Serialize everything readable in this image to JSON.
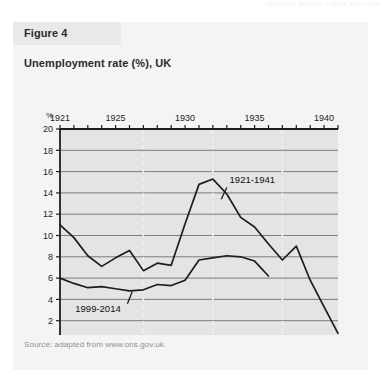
{
  "running_header": "Appendix  Section 4  Data and more",
  "figure": {
    "header_label": "Figure 4",
    "title": "Unemployment rate (%), UK",
    "source": "Source: adapted from www.ons.gov.uk."
  },
  "colors": {
    "panel_bg": "#f4f4f5",
    "header_bg": "#e9e9ea",
    "plot_bg": "#e4e4e4",
    "gridline": "#6f6f6f",
    "dashed_gridline": "#f2f2f2",
    "axis": "#1d1d1d",
    "series_line": "#1d1d1d",
    "text": "#2b2b2b",
    "source_text": "#8e8e96"
  },
  "chart_data": {
    "type": "line",
    "title": "Unemployment rate (%), UK",
    "xlabel": "",
    "ylabel": "%",
    "ylim": [
      0,
      20
    ],
    "ytick_step": 2,
    "yticks": [
      0,
      2,
      4,
      6,
      8,
      10,
      12,
      14,
      16,
      18,
      20
    ],
    "grid": true,
    "grid_axis": "y",
    "dashed_vertical_gridlines_top": [
      1927,
      1932,
      1937
    ],
    "dashed_vertical_gridlines_bottom": [
      2005,
      2010,
      2015
    ],
    "legend_position": "inline-annotation",
    "axis_top": {
      "name": "1921-1941",
      "range": [
        1921,
        1941
      ],
      "tick_step": 1,
      "labeled_ticks": [
        "1921",
        "1925",
        "1930",
        "1935",
        "1940"
      ],
      "labeled_values": [
        1921,
        1925,
        1930,
        1935,
        1940
      ]
    },
    "axis_bottom": {
      "name": "1999-2014",
      "range": [
        1999,
        2019
      ],
      "tick_step": 1,
      "labeled_ticks": [
        "2000",
        "2005",
        "2010",
        "2014"
      ],
      "labeled_values": [
        2000,
        2005,
        2010,
        2014
      ]
    },
    "series": [
      {
        "name": "1921-1941",
        "annotation": "1921-1941",
        "axis": "top",
        "x": [
          1921,
          1922,
          1923,
          1924,
          1925,
          1926,
          1927,
          1928,
          1929,
          1930,
          1931,
          1932,
          1933,
          1934,
          1935,
          1936,
          1937,
          1938,
          1939,
          1940,
          1941
        ],
        "values": [
          11.0,
          9.8,
          8.1,
          7.1,
          7.9,
          8.6,
          6.7,
          7.4,
          7.2,
          11.1,
          14.8,
          15.3,
          13.9,
          11.7,
          10.8,
          9.2,
          7.7,
          9.0,
          5.8,
          3.3,
          0.8
        ]
      },
      {
        "name": "1999-2014",
        "annotation": "1999-2014",
        "axis": "bottom",
        "x": [
          1999,
          2000,
          2001,
          2002,
          2003,
          2004,
          2005,
          2006,
          2007,
          2008,
          2009,
          2010,
          2011,
          2012,
          2013,
          2014
        ],
        "values": [
          6.0,
          5.5,
          5.1,
          5.2,
          5.0,
          4.8,
          4.9,
          5.4,
          5.3,
          5.8,
          7.7,
          7.9,
          8.1,
          8.0,
          7.6,
          6.2
        ]
      }
    ]
  }
}
